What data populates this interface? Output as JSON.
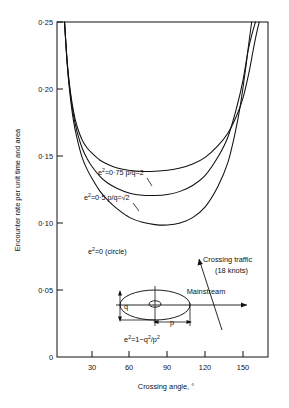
{
  "figure": {
    "background": "#ffffff",
    "ink": "#111111"
  },
  "chart_data": {
    "type": "line",
    "title": "",
    "xlabel": "Crossing angle, °",
    "ylabel": "Encounter rate per unit time and area",
    "xlim": [
      2,
      170
    ],
    "ylim": [
      0,
      0.25
    ],
    "grid": false,
    "legend_position": "inline-curve-labels",
    "xticks": [
      "30",
      "60",
      "90",
      "120",
      "150"
    ],
    "xtick_values": [
      30,
      60,
      90,
      120,
      150
    ],
    "yticks": [
      "0",
      "0·05",
      "0·10",
      "0·15",
      "0·20",
      "0·25"
    ],
    "ytick_values": [
      0,
      0.05,
      0.1,
      0.15,
      0.2,
      0.25
    ],
    "series": [
      {
        "name": "e²=0·75 p/q=2",
        "label_parts": {
          "base": "e",
          "exp": "2",
          "rest": "=0·75 p/q=2"
        },
        "x": [
          8,
          10,
          12,
          15,
          18,
          22,
          26,
          30,
          36,
          42,
          50,
          60,
          70,
          80,
          90,
          100,
          110,
          120,
          130,
          138,
          145,
          150,
          155,
          158,
          161,
          163
        ],
        "values": [
          0.25,
          0.222,
          0.203,
          0.184,
          0.172,
          0.162,
          0.156,
          0.152,
          0.147,
          0.144,
          0.141,
          0.1392,
          0.1385,
          0.1386,
          0.1393,
          0.141,
          0.144,
          0.149,
          0.1575,
          0.167,
          0.18,
          0.193,
          0.213,
          0.228,
          0.242,
          0.25
        ]
      },
      {
        "name": "e²=0·5 p/q=√2",
        "label_parts": {
          "base": "e",
          "exp": "2",
          "rest": "=0·5 p/q=√2"
        },
        "x": [
          8,
          10,
          12,
          15,
          18,
          22,
          26,
          30,
          36,
          42,
          50,
          60,
          70,
          80,
          90,
          100,
          110,
          120,
          130,
          138,
          145,
          150,
          154,
          157,
          160
        ],
        "values": [
          0.25,
          0.221,
          0.201,
          0.181,
          0.168,
          0.156,
          0.148,
          0.142,
          0.135,
          0.13,
          0.1258,
          0.1222,
          0.1207,
          0.1205,
          0.1213,
          0.1236,
          0.128,
          0.1355,
          0.149,
          0.164,
          0.186,
          0.206,
          0.228,
          0.24,
          0.25
        ]
      },
      {
        "name": "e²=0 (circle)",
        "label_parts": {
          "base": "e",
          "exp": "2",
          "rest": "=0 (circle)"
        },
        "x": [
          8,
          10,
          12,
          15,
          18,
          22,
          26,
          30,
          36,
          42,
          50,
          60,
          70,
          80,
          90,
          100,
          110,
          120,
          130,
          138,
          144,
          148,
          152,
          155,
          157
        ],
        "values": [
          0.25,
          0.22,
          0.199,
          0.177,
          0.163,
          0.149,
          0.14,
          0.133,
          0.124,
          0.1175,
          0.1105,
          0.104,
          0.1005,
          0.0988,
          0.0985,
          0.1,
          0.104,
          0.112,
          0.127,
          0.145,
          0.168,
          0.188,
          0.214,
          0.236,
          0.25
        ]
      }
    ],
    "annotations": [
      {
        "name": "crossing-traffic",
        "text_line1": "Crossing  traffic",
        "text_line2": "(18 knots)"
      },
      {
        "name": "mainstream",
        "text": "Mainstream"
      },
      {
        "name": "ellipse-formula",
        "base": "e",
        "exp": "2",
        "rest": "=1−q",
        "exp2": "2",
        "rest2": "/p",
        "exp3": "2"
      },
      {
        "name": "semi-minor-axis",
        "text": "q"
      },
      {
        "name": "semi-major-axis",
        "text": "p"
      }
    ]
  },
  "curve_labels": [
    {
      "prefix": "e",
      "sup": "2",
      "suffix": "=0·75 p/q=2"
    },
    {
      "prefix": "e",
      "sup": "2",
      "suffix": "=0·5 p/q=",
      "radical": "√2"
    },
    {
      "prefix": "e",
      "sup": "2",
      "suffix": "=0 (circle)"
    }
  ],
  "diagram": {
    "crossing_traffic_line1": "Crossing  traffic",
    "crossing_traffic_line2": "(18 knots)",
    "mainstream": "Mainstream",
    "q_label": "q",
    "p_label": "p",
    "formula_prefix": "e",
    "formula_sup": "2",
    "formula_mid": "=1−q",
    "formula_sup2": "2",
    "formula_mid2": "/p",
    "formula_sup3": "2"
  },
  "axes": {
    "y_title": "Encounter rate per unit time and area",
    "x_title": "Crossing angle, °",
    "y_ticks": [
      "0·25",
      "0·20",
      "0·15",
      "0·10",
      "0·05",
      "0"
    ],
    "x_ticks": [
      "30",
      "60",
      "90",
      "120",
      "150"
    ]
  }
}
